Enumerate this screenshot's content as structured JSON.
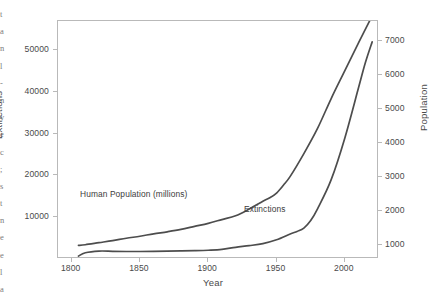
{
  "page": {
    "margin_fragments": [
      "t",
      "a",
      "n",
      "l",
      "-",
      "n",
      "y",
      "e",
      "c",
      ";",
      "s",
      "t",
      "n",
      "e",
      "e",
      "l",
      "a"
    ]
  },
  "chart_data": {
    "type": "line",
    "title": "",
    "xlabel": "Year",
    "ylabel": "Extinctions",
    "y2label": "Population",
    "grid": false,
    "legend": "inline-annotations",
    "xlim": [
      1790,
      2025
    ],
    "ylim": [
      0,
      57000
    ],
    "y2lim": [
      600,
      7600
    ],
    "xticks": [
      1800,
      1850,
      1900,
      1950,
      2000
    ],
    "xtick_labels": [
      "1800",
      "1850",
      "1900",
      "1950",
      "2000"
    ],
    "yticks": [
      10000,
      20000,
      30000,
      40000,
      50000
    ],
    "ytick_labels": [
      "10000",
      "20000",
      "30000",
      "40000",
      "50000"
    ],
    "y2ticks": [
      1000,
      2000,
      3000,
      4000,
      5000,
      6000,
      7000
    ],
    "y2tick_labels": [
      "1000",
      "2000",
      "3000",
      "4000",
      "5000",
      "6000",
      "7000"
    ],
    "line_color": "#4d4d4d",
    "series": [
      {
        "name": "Human Population (millions)",
        "axis": "right",
        "annotation": "Human Population (millions)",
        "x": [
          1805,
          1810,
          1820,
          1830,
          1840,
          1850,
          1860,
          1870,
          1880,
          1890,
          1900,
          1910,
          1920,
          1930,
          1940,
          1945,
          1950,
          1955,
          1960,
          1970,
          1980,
          1990,
          2000,
          2010,
          2020
        ],
        "values": [
          1000,
          1020,
          1080,
          1140,
          1210,
          1270,
          1340,
          1400,
          1470,
          1560,
          1650,
          1760,
          1870,
          2070,
          2300,
          2400,
          2540,
          2770,
          3030,
          3700,
          4440,
          5320,
          6140,
          6960,
          7750
        ]
      },
      {
        "name": "Extinctions",
        "axis": "left",
        "annotation": "Extinctions",
        "x": [
          1805,
          1810,
          1820,
          1830,
          1840,
          1850,
          1860,
          1870,
          1880,
          1890,
          1900,
          1910,
          1920,
          1930,
          1940,
          1950,
          1960,
          1965,
          1970,
          1975,
          1980,
          1990,
          2000,
          2010,
          2015,
          2020
        ],
        "values": [
          700,
          1500,
          1900,
          1850,
          1800,
          1800,
          1850,
          1900,
          1950,
          2000,
          2100,
          2300,
          2800,
          3200,
          3700,
          4600,
          6000,
          6600,
          7400,
          9200,
          12000,
          19000,
          29000,
          41000,
          47000,
          52000
        ]
      }
    ]
  }
}
